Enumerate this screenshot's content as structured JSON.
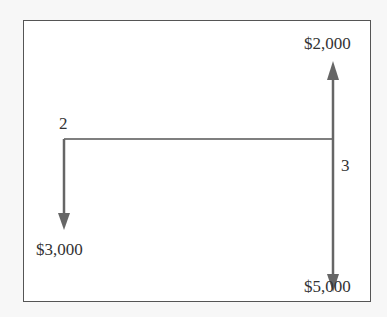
{
  "diagram": {
    "type": "cash-flow diagram",
    "period_labels": {
      "start": "2",
      "end": "3"
    },
    "cash_flows": [
      {
        "period": "2",
        "direction": "down",
        "amount": "$3,000"
      },
      {
        "period": "3",
        "direction": "up",
        "amount": "$2,000"
      },
      {
        "period": "3",
        "direction": "down",
        "amount": "$5,000"
      }
    ],
    "colors": {
      "arrow": "#666666",
      "line": "#555555",
      "frame": "#555555"
    }
  }
}
